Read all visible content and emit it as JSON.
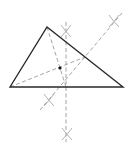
{
  "diagram": {
    "type": "geometric-construction",
    "colors": {
      "triangle_stroke": "#2a2a2a",
      "construction_stroke": "#9a9a9a",
      "arc_marks": "#a8a8a8",
      "point": "#111111",
      "background": "#ffffff"
    },
    "triangle": {
      "vertices": [
        {
          "name": "left",
          "x": 10,
          "y": 87
        },
        {
          "name": "top",
          "x": 47,
          "y": 27
        },
        {
          "name": "right",
          "x": 123,
          "y": 87
        }
      ]
    },
    "construction_lines": [
      {
        "name": "perpendicular-bisector-base",
        "x1": 66,
        "y1": 22,
        "x2": 66,
        "y2": 142
      },
      {
        "name": "perpendicular-bisector-right-side",
        "x1": 40,
        "y1": 110,
        "x2": 122,
        "y2": 13
      },
      {
        "name": "median-from-left-vertex",
        "x1": 10,
        "y1": 87,
        "x2": 85,
        "y2": 57
      },
      {
        "name": "median-from-top-vertex",
        "x1": 47,
        "y1": 27,
        "x2": 66,
        "y2": 87
      }
    ],
    "arc_marks": [
      {
        "name": "arc-mark-top",
        "x": 66,
        "y": 31
      },
      {
        "name": "arc-mark-bottom",
        "x": 67,
        "y": 134
      },
      {
        "name": "arc-mark-upper-right",
        "x": 114,
        "y": 21
      },
      {
        "name": "arc-mark-lower-left",
        "x": 49,
        "y": 100
      }
    ],
    "point": {
      "name": "centroid",
      "x": 60,
      "y": 68,
      "r": 1.6
    }
  }
}
